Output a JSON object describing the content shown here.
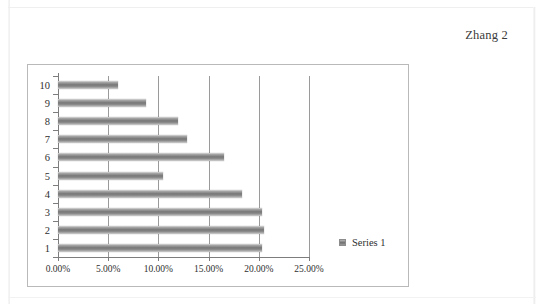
{
  "document": {
    "running_header": "Zhang 2"
  },
  "chart": {
    "legend": {
      "position": "right",
      "entries": [
        {
          "label": "Series 1",
          "swatch_name": "series-1-swatch"
        }
      ]
    },
    "border_color": "#b9b9b9",
    "plot_background": "#ffffff",
    "bar_color": "#767676",
    "gridline_color": "#9a9a9a",
    "axis_color": "#7d7d7d"
  },
  "chart_data": {
    "type": "bar",
    "orientation": "horizontal",
    "title": "",
    "xlabel": "",
    "ylabel": "",
    "grid": true,
    "legend_position": "right",
    "xlim": [
      0,
      25
    ],
    "xticks": [
      0,
      5,
      10,
      15,
      20,
      25
    ],
    "xtick_labels": [
      "0.00%",
      "5.00%",
      "10.00%",
      "15.00%",
      "20.00%",
      "25.00%"
    ],
    "categories": [
      "1",
      "2",
      "3",
      "4",
      "5",
      "6",
      "7",
      "8",
      "9",
      "10"
    ],
    "series": [
      {
        "name": "Series 1",
        "values": [
          20.3,
          20.5,
          20.3,
          18.3,
          10.5,
          16.5,
          12.8,
          12.0,
          8.8,
          6.0
        ]
      }
    ]
  }
}
